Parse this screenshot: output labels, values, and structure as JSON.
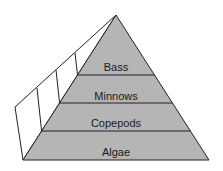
{
  "diagram": {
    "type": "food-pyramid",
    "colors": {
      "fill": "#b5b5b5",
      "stroke": "#222222",
      "side": "#ffffff"
    },
    "levels": [
      {
        "label": "Bass"
      },
      {
        "label": "Minnows"
      },
      {
        "label": "Copepods"
      },
      {
        "label": "Algae"
      }
    ]
  }
}
